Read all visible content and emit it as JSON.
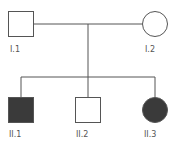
{
  "diagram": {
    "type": "pedigree",
    "colors": {
      "affected_fill": "#3a3a3a",
      "unaffected_fill": "#ffffff",
      "line": "#555555"
    },
    "individuals": [
      {
        "id": "I.1",
        "label": "I.1",
        "sex": "male",
        "affected": false,
        "generation": 1
      },
      {
        "id": "I.2",
        "label": "I.2",
        "sex": "female",
        "affected": false,
        "generation": 1
      },
      {
        "id": "II.1",
        "label": "II.1",
        "sex": "male",
        "affected": true,
        "generation": 2
      },
      {
        "id": "II.2",
        "label": "II.2",
        "sex": "male",
        "affected": false,
        "generation": 2
      },
      {
        "id": "II.3",
        "label": "II.3",
        "sex": "female",
        "affected": true,
        "generation": 2
      }
    ],
    "relationships": [
      {
        "type": "mating",
        "partners": [
          "I.1",
          "I.2"
        ],
        "children": [
          "II.1",
          "II.2",
          "II.3"
        ]
      }
    ]
  }
}
